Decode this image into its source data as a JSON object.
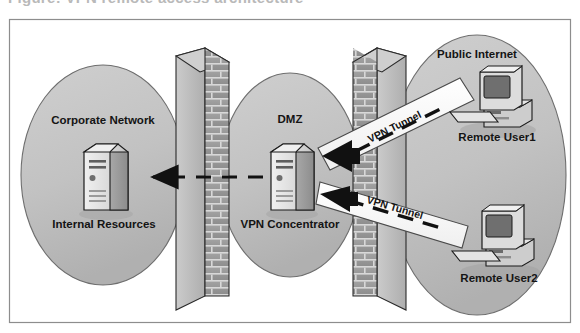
{
  "figure": {
    "cropped_title_text": "Figure: VPN remote access architecture",
    "border_color": "#8d8d8d",
    "background_color": "#ffffff"
  },
  "palette": {
    "cloud_fill": "#c2c2c2",
    "cloud_stroke": "#6e6e6e",
    "brick_face": "#9a9a9a",
    "brick_mortar": "#d8d8d8",
    "brick_side": "#bdbdbd",
    "brick_top": "#cfcfcf",
    "brick_outline": "#2a2a2a",
    "server_light": "#e3e3e3",
    "server_mid": "#b6b6b6",
    "server_dark": "#8f8f8f",
    "tunnel_fill": "#fbfbfb",
    "tunnel_stroke": "#4a4a4a",
    "arrow_black": "#111111",
    "text_color": "#141414"
  },
  "zones": [
    {
      "id": "corporate-network",
      "label": "Corporate  Network",
      "node_label": "Internal Resources",
      "node_type": "server-tower"
    },
    {
      "id": "dmz",
      "label": "DMZ",
      "node_label": "VPN Concentrator",
      "node_type": "server-tower"
    },
    {
      "id": "public-internet",
      "label": "Public Internet",
      "node_type": "cloud"
    }
  ],
  "firewalls": [
    {
      "id": "inner-firewall",
      "name": "brick-wall-firewall-inner",
      "orientation": "left"
    },
    {
      "id": "outer-firewall",
      "name": "brick-wall-firewall-outer",
      "orientation": "right"
    }
  ],
  "endpoints": [
    {
      "id": "remote-user-1",
      "label": "Remote User1",
      "node_type": "desktop-computer"
    },
    {
      "id": "remote-user-2",
      "label": "Remote User2",
      "node_type": "desktop-computer"
    }
  ],
  "tunnels": [
    {
      "id": "tunnel-1",
      "label": "VPN Tunnel",
      "from": "remote-user-1",
      "to": "vpn-concentrator"
    },
    {
      "id": "tunnel-2",
      "label": "VPN Tunnel",
      "from": "remote-user-2",
      "to": "vpn-concentrator"
    }
  ],
  "flows": [
    {
      "id": "internal-flow",
      "style": "dashed-arrow",
      "from": "vpn-concentrator",
      "to": "internal-resources"
    }
  ]
}
